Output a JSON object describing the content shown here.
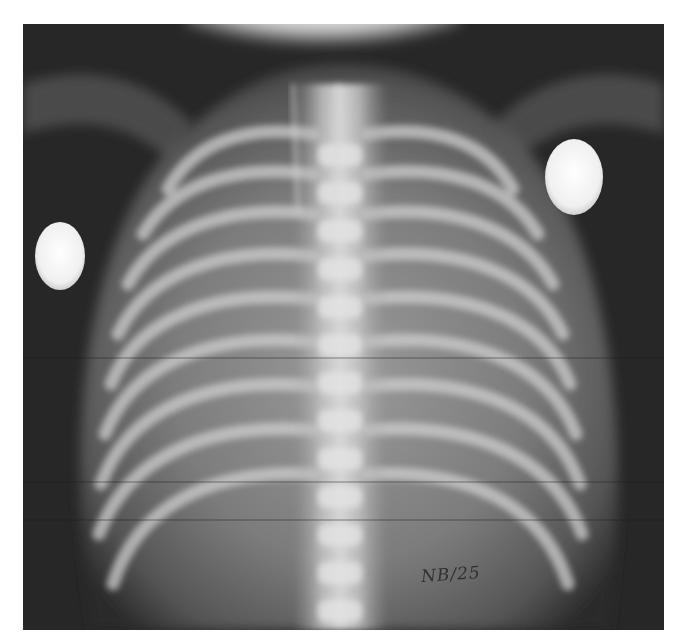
{
  "image": {
    "description": "Neonatal chest radiograph (AP view) showing rib cage, spine and two round skin markers",
    "label_text": "NB/25",
    "colors": {
      "background": "#2a2a2a",
      "soft_tissue": "#8a8a8a",
      "bone": "#d8d8d8",
      "marker": "#f4f4f4"
    }
  }
}
